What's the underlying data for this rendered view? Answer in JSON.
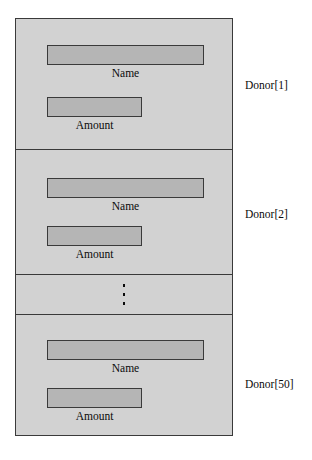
{
  "diagram": {
    "colors": {
      "page_background": "#ffffff",
      "cell_background": "#d2d2d2",
      "field_fill": "#b5b5b5",
      "stroke": "#3a3a3a",
      "text": "#0a0a0a"
    },
    "records": [
      {
        "id": "donor-1",
        "annotation": "Donor[1]",
        "fields": [
          {
            "name": "name",
            "label": "Name"
          },
          {
            "name": "amount",
            "label": "Amount"
          }
        ]
      },
      {
        "id": "donor-2",
        "annotation": "Donor[2]",
        "fields": [
          {
            "name": "name",
            "label": "Name"
          },
          {
            "name": "amount",
            "label": "Amount"
          }
        ]
      },
      {
        "id": "donor-50",
        "annotation": "Donor[50]",
        "fields": [
          {
            "name": "name",
            "label": "Name"
          },
          {
            "name": "amount",
            "label": "Amount"
          }
        ]
      }
    ],
    "ellipsis": {
      "glyph": "vertical-ellipsis",
      "dot_count": 3,
      "meaning": "records 3 through 49 omitted"
    }
  }
}
